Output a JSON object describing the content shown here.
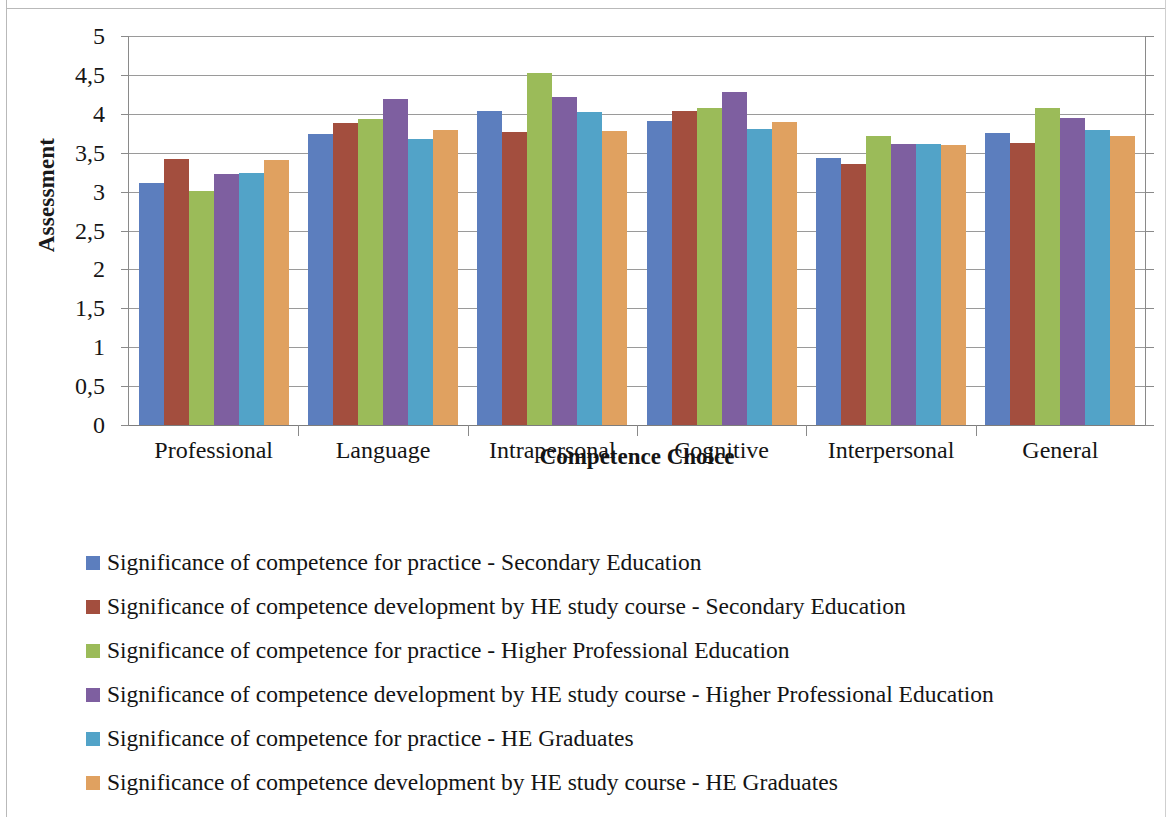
{
  "chart_data": {
    "type": "bar",
    "title": "",
    "xlabel": "Competence Choice",
    "ylabel": "Assessment",
    "ylim": [
      0,
      5
    ],
    "ytick_labels": [
      "5",
      "4,5",
      "4",
      "3,5",
      "3",
      "2,5",
      "2",
      "1,5",
      "1",
      "0,5",
      "0"
    ],
    "ytick_values": [
      5,
      4.5,
      4,
      3.5,
      3,
      2.5,
      2,
      1.5,
      1,
      0.5,
      0
    ],
    "grid": true,
    "legend_position": "bottom-left",
    "categories": [
      "Professional",
      "Language",
      "Intrapersonal",
      "Cognitive",
      "Interpersonal",
      "General"
    ],
    "series": [
      {
        "name": "Significance of competence for practice - Secondary Education",
        "color": "#5C7EBE",
        "values": [
          3.11,
          3.74,
          4.04,
          3.91,
          3.43,
          3.75
        ]
      },
      {
        "name": "Significance of competence development by HE study course - Secondary Education",
        "color": "#A34E3E",
        "values": [
          3.42,
          3.88,
          3.76,
          4.04,
          3.36,
          3.63
        ]
      },
      {
        "name": "Significance of competence for practice - Higher Professional Education",
        "color": "#9BBB59",
        "values": [
          3.01,
          3.93,
          4.52,
          4.08,
          3.72,
          4.08
        ]
      },
      {
        "name": "Significance of competence development by HE study course - Higher Professional Education",
        "color": "#7E5FA0",
        "values": [
          3.23,
          4.19,
          4.22,
          4.28,
          3.61,
          3.94
        ]
      },
      {
        "name": "Significance of competence for practice - HE Graduates",
        "color": "#52A3C8",
        "values": [
          3.24,
          3.68,
          4.02,
          3.8,
          3.61,
          3.79
        ]
      },
      {
        "name": "Significance of competence development by HE study course - HE Graduates",
        "color": "#E0A160",
        "values": [
          3.4,
          3.79,
          3.78,
          3.89,
          3.6,
          3.72
        ]
      }
    ]
  }
}
